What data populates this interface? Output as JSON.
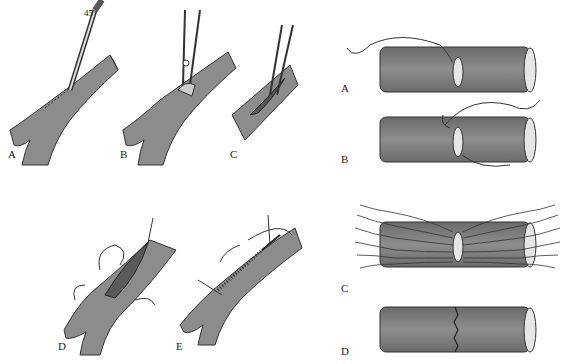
{
  "figure": {
    "left_panels": [
      {
        "label": "A",
        "caption_pos": [
          8,
          155
        ],
        "annotation": "45°"
      },
      {
        "label": "B",
        "caption_pos": [
          120,
          155
        ]
      },
      {
        "label": "C",
        "caption_pos": [
          230,
          155
        ]
      },
      {
        "label": "D",
        "caption_pos": [
          58,
          348
        ]
      },
      {
        "label": "E",
        "caption_pos": [
          176,
          348
        ]
      }
    ],
    "right_panels": [
      {
        "label": "A",
        "caption_pos": [
          341,
          82
        ]
      },
      {
        "label": "B",
        "caption_pos": [
          341,
          153
        ]
      },
      {
        "label": "C",
        "caption_pos": [
          341,
          282
        ]
      },
      {
        "label": "D",
        "caption_pos": [
          341,
          345
        ]
      }
    ],
    "colors": {
      "vessel_fill": "#8c8c8c",
      "vessel_dark": "#6e6e6e",
      "outline": "#333333",
      "lumen": "#e6e6e6",
      "background": "#ffffff"
    }
  }
}
